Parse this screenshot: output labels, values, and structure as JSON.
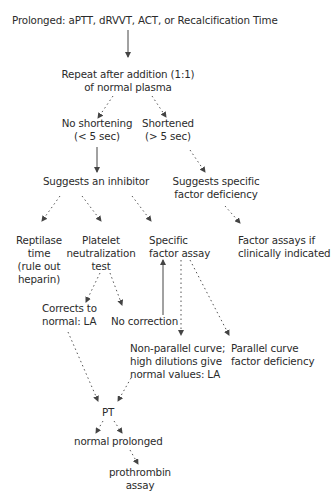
{
  "diagram": {
    "type": "flowchart",
    "nodes": {
      "start": {
        "lines": [
          "Prolonged: aPTT, dRVVT, ACT, or Recalcification Time"
        ]
      },
      "repeat": {
        "lines": [
          "Repeat after addition (1:1)",
          "of normal plasma"
        ]
      },
      "no_shortening": {
        "lines": [
          "No shortening",
          "(< 5 sec)"
        ]
      },
      "shortened": {
        "lines": [
          "Shortened",
          "(> 5 sec)"
        ]
      },
      "inhibitor": {
        "lines": [
          "Suggests an inhibitor"
        ]
      },
      "deficiency": {
        "lines": [
          "Suggests specific",
          "factor deficiency"
        ]
      },
      "reptilase": {
        "lines": [
          "Reptilase",
          "time",
          "(rule out",
          "heparin)"
        ]
      },
      "platelet": {
        "lines": [
          "Platelet",
          "neutralization",
          "test"
        ]
      },
      "specific_assay": {
        "lines": [
          "Specific",
          "factor assay"
        ]
      },
      "factor_assays": {
        "lines": [
          "Factor assays if",
          "clinically indicated"
        ]
      },
      "corrects": {
        "lines": [
          "Corrects to",
          "normal: LA"
        ]
      },
      "no_correction": {
        "lines": [
          "No correction"
        ]
      },
      "nonparallel": {
        "lines": [
          "Non-parallel curve;",
          "high dilutions give",
          "normal values: LA"
        ]
      },
      "parallel": {
        "lines": [
          "Parallel curve",
          "factor deficiency"
        ]
      },
      "pt": {
        "lines": [
          "PT"
        ]
      },
      "normal": {
        "lines": [
          "normal"
        ]
      },
      "prolonged": {
        "lines": [
          "prolonged"
        ]
      },
      "prothrombin": {
        "lines": [
          "prothrombin",
          "assay"
        ]
      }
    },
    "edges": [
      {
        "from": "start",
        "to": "repeat",
        "style": "solid"
      },
      {
        "from": "repeat",
        "to": "no_shortening",
        "style": "dotted"
      },
      {
        "from": "repeat",
        "to": "shortened",
        "style": "dotted"
      },
      {
        "from": "no_shortening",
        "to": "inhibitor",
        "style": "solid"
      },
      {
        "from": "shortened",
        "to": "deficiency",
        "style": "dotted"
      },
      {
        "from": "inhibitor",
        "to": "reptilase",
        "style": "dotted"
      },
      {
        "from": "inhibitor",
        "to": "platelet",
        "style": "dotted"
      },
      {
        "from": "inhibitor",
        "to": "specific_assay",
        "style": "dotted"
      },
      {
        "from": "deficiency",
        "to": "factor_assays",
        "style": "dotted"
      },
      {
        "from": "platelet",
        "to": "corrects",
        "style": "dotted"
      },
      {
        "from": "platelet",
        "to": "no_correction",
        "style": "dotted"
      },
      {
        "from": "no_correction",
        "to": "specific_assay",
        "style": "solid"
      },
      {
        "from": "specific_assay",
        "to": "nonparallel",
        "style": "dotted"
      },
      {
        "from": "specific_assay",
        "to": "parallel",
        "style": "dotted"
      },
      {
        "from": "corrects",
        "to": "pt",
        "style": "dotted"
      },
      {
        "from": "nonparallel",
        "to": "pt",
        "style": "dotted"
      },
      {
        "from": "pt",
        "to": "normal",
        "style": "dotted"
      },
      {
        "from": "pt",
        "to": "prolonged",
        "style": "dotted"
      },
      {
        "from": "prolonged",
        "to": "prothrombin",
        "style": "dotted"
      }
    ],
    "colors": {
      "text": "#2b2b2b",
      "edge": "#444444",
      "background": "#ffffff"
    }
  }
}
